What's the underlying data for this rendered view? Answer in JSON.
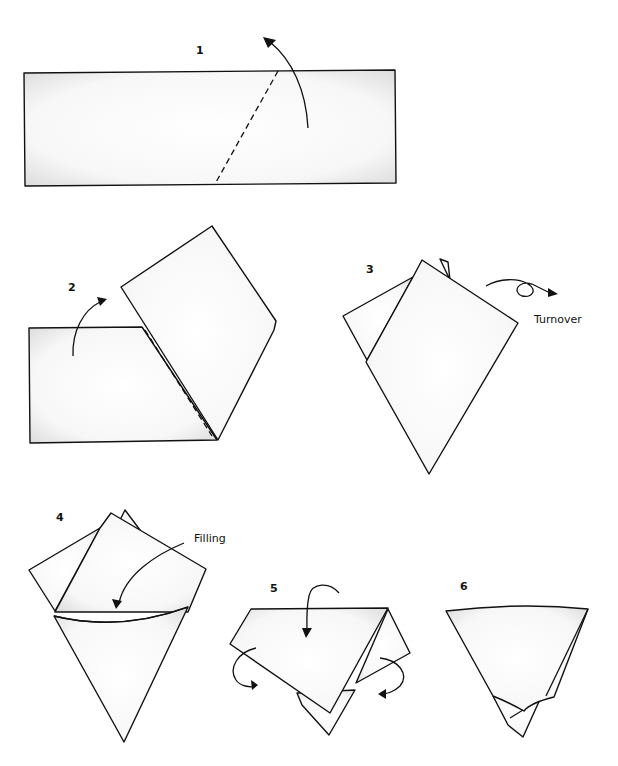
{
  "diagram": {
    "steps": [
      {
        "number": "1",
        "caption": ""
      },
      {
        "number": "2",
        "caption": ""
      },
      {
        "number": "3",
        "caption": "Turnover"
      },
      {
        "number": "4",
        "caption": "Filling"
      },
      {
        "number": "5",
        "caption": ""
      },
      {
        "number": "6",
        "caption": ""
      }
    ]
  }
}
